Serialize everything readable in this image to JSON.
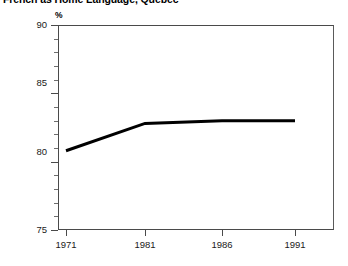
{
  "title": "French as Home Language, Quebec",
  "unit_label": "%",
  "axis": {
    "y_ticks": [
      "75",
      "80",
      "85",
      "90"
    ],
    "y_minor_count": 4,
    "x_ticks": [
      "1971",
      "1981",
      "1986",
      "1991"
    ]
  },
  "colors": {
    "line": "#000000",
    "frame": "#4a4a4a",
    "text": "#1a1a1a",
    "background": "#ffffff"
  },
  "chart_data": {
    "type": "line",
    "title": "French as Home Language, Quebec",
    "xlabel": "",
    "ylabel": "%",
    "categories": [
      "1971",
      "1981",
      "1986",
      "1991"
    ],
    "values": [
      80.8,
      82.8,
      83.0,
      83.0
    ],
    "series": [
      {
        "name": "French as home language",
        "values": [
          80.8,
          82.8,
          83.0,
          83.0
        ]
      }
    ],
    "ylim": [
      75,
      90
    ],
    "y_ticks": [
      75,
      80,
      85,
      90
    ],
    "y_minor_ticks": [
      76,
      77,
      78,
      79,
      81,
      82,
      83,
      84,
      86,
      87,
      88,
      89
    ],
    "grid": false,
    "legend": false,
    "line_color": "#000000",
    "line_width": 3,
    "markers": false
  }
}
